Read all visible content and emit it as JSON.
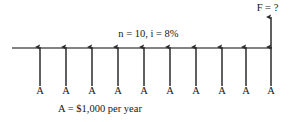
{
  "diagram": {
    "type": "cash-flow-diagram",
    "timeline": {
      "x_start": 12,
      "x_end": 272,
      "y": 48,
      "color": "#555555",
      "stroke_width": 1.3
    },
    "parameters_label": "n = 10, i = 8%",
    "future_value_label": "F = ?",
    "caption": "A = $1,000 per year",
    "annuity_symbol": "A",
    "periods": 10,
    "interest_rate": "8%",
    "annuity_amount": "$1,000",
    "colors": {
      "stroke": "#2b2b2b",
      "axis": "#555555",
      "text": "#161616",
      "background": "#ffffff"
    },
    "cash_flows": [
      {
        "index": 1,
        "x": 40,
        "label": "A",
        "direction": "up",
        "y_tail": 86,
        "y_head": 47
      },
      {
        "index": 2,
        "x": 66,
        "label": "A",
        "direction": "up",
        "y_tail": 86,
        "y_head": 47
      },
      {
        "index": 3,
        "x": 92,
        "label": "A",
        "direction": "up",
        "y_tail": 86,
        "y_head": 47
      },
      {
        "index": 4,
        "x": 118,
        "label": "A",
        "direction": "up",
        "y_tail": 86,
        "y_head": 47
      },
      {
        "index": 5,
        "x": 144,
        "label": "A",
        "direction": "up",
        "y_tail": 86,
        "y_head": 47
      },
      {
        "index": 6,
        "x": 170,
        "label": "A",
        "direction": "up",
        "y_tail": 86,
        "y_head": 47
      },
      {
        "index": 7,
        "x": 196,
        "label": "A",
        "direction": "up",
        "y_tail": 86,
        "y_head": 47
      },
      {
        "index": 8,
        "x": 222,
        "label": "A",
        "direction": "up",
        "y_tail": 86,
        "y_head": 47
      },
      {
        "index": 9,
        "x": 246,
        "label": "A",
        "direction": "up",
        "y_tail": 86,
        "y_head": 47
      },
      {
        "index": 10,
        "x": 271,
        "label": "A",
        "direction": "up",
        "y_tail": 86,
        "y_head": 47
      }
    ],
    "future_arrow": {
      "x": 271,
      "y_tail": 48,
      "y_head": 17,
      "direction": "up",
      "label": "F = ?"
    }
  }
}
